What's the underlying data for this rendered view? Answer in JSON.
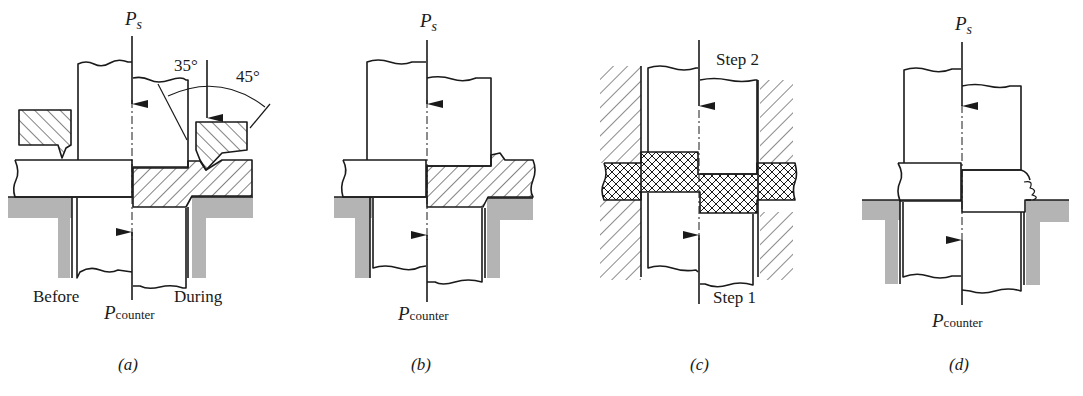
{
  "figure": {
    "panels": [
      {
        "id": "a",
        "caption": "(a)",
        "force_top": {
          "symbol": "P",
          "subscript": "s"
        },
        "force_bottom": {
          "symbol": "P",
          "subscript": "counter"
        },
        "labels": {
          "before": "Before",
          "during": "During"
        },
        "angles": [
          "35°",
          "45°"
        ]
      },
      {
        "id": "b",
        "caption": "(b)",
        "force_top": {
          "symbol": "P",
          "subscript": "s"
        },
        "force_bottom": {
          "symbol": "P",
          "subscript": "counter"
        }
      },
      {
        "id": "c",
        "caption": "(c)",
        "labels": {
          "step_top": "Step 2",
          "step_bottom": "Step 1"
        }
      },
      {
        "id": "d",
        "caption": "(d)",
        "force_top": {
          "symbol": "P",
          "subscript": "s"
        },
        "force_bottom": {
          "symbol": "P",
          "subscript": "counter"
        }
      }
    ],
    "colors": {
      "line": "#1a1a1a",
      "die_gray": "#b4b4b4",
      "background": "#ffffff"
    }
  }
}
